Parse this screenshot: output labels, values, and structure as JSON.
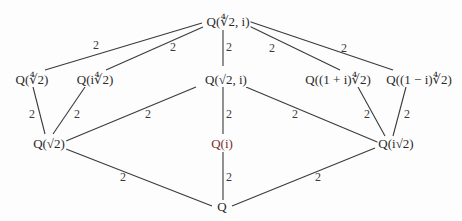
{
  "diagram": {
    "type": "field extension lattice",
    "line_color": "#3a3a3a",
    "nodes": {
      "top": "Q(∜2, i)",
      "q4rt2": "Q(∜2)",
      "qi4rt2": "Q(i∜2)",
      "qsqrt2i": "Q(√2, i)",
      "q1pi": "Q((1 + i)∜2)",
      "q1mi": "Q((1 − i)∜2)",
      "qsqrt2": "Q(√2)",
      "qi": "Q(i)",
      "qisqrt2": "Q(i√2)",
      "bottom": "Q"
    },
    "edges": [
      {
        "from": "top",
        "to": "q4rt2",
        "label": "2"
      },
      {
        "from": "top",
        "to": "qi4rt2",
        "label": "2"
      },
      {
        "from": "top",
        "to": "qsqrt2i",
        "label": "2"
      },
      {
        "from": "top",
        "to": "q1pi",
        "label": "2"
      },
      {
        "from": "top",
        "to": "q1mi",
        "label": "2"
      },
      {
        "from": "q4rt2",
        "to": "qsqrt2",
        "label": "2"
      },
      {
        "from": "qi4rt2",
        "to": "qsqrt2",
        "label": "2"
      },
      {
        "from": "qsqrt2i",
        "to": "qsqrt2",
        "label": "2"
      },
      {
        "from": "qsqrt2i",
        "to": "qi",
        "label": "2"
      },
      {
        "from": "qsqrt2i",
        "to": "qisqrt2",
        "label": "2"
      },
      {
        "from": "q1pi",
        "to": "qisqrt2",
        "label": "2"
      },
      {
        "from": "q1mi",
        "to": "qisqrt2",
        "label": "2"
      },
      {
        "from": "qsqrt2",
        "to": "bottom",
        "label": "2"
      },
      {
        "from": "qi",
        "to": "bottom",
        "label": "2"
      },
      {
        "from": "qisqrt2",
        "to": "bottom",
        "label": "2"
      }
    ]
  }
}
